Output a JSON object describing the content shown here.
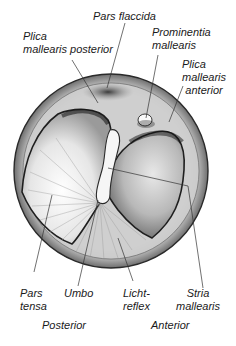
{
  "figure": {
    "labels": {
      "pars_flaccida": [
        "Pars flaccida"
      ],
      "plica_posterior": [
        "Plica",
        "mallearis posterior"
      ],
      "prominentia": [
        "Prominentia",
        "mallearis"
      ],
      "plica_anterior": [
        "Plica",
        "mallearis",
        "anterior"
      ],
      "pars_tensa": [
        "Pars",
        "tensa"
      ],
      "umbo": [
        "Umbo"
      ],
      "lichtreflex": [
        "Licht-",
        "reflex"
      ],
      "stria": [
        "Stria",
        "mallearis"
      ]
    },
    "orientation": {
      "posterior": "Posterior",
      "anterior": "Anterior"
    },
    "colors": {
      "outline": "#2a2a2a",
      "membrane_light": "#f2f2f2",
      "membrane_mid": "#bdbdbd",
      "membrane_dark": "#3a3a3a",
      "leader_line": "#333333"
    }
  }
}
